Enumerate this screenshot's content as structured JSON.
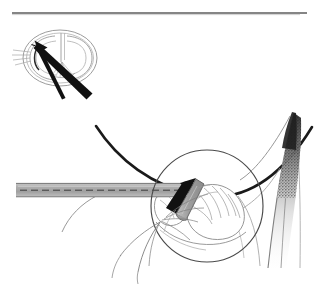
{
  "figure": {
    "title": "Surgical technique illustration",
    "canvas": {
      "width": 316,
      "height": 284
    },
    "background_color": "#ffffff"
  },
  "colors": {
    "ink_black": "#111111",
    "line_dark": "#1a1a1a",
    "line_mid": "#6b6b6b",
    "line_light": "#9a9a9a",
    "line_faint": "#b9b9b9",
    "instrument_gray": "#a8a8a8",
    "instrument_gray_dark": "#8d8d8d",
    "instrument_gray_light": "#c4c4c4",
    "rule_gray": "#5c5c5c",
    "tissue_outline": "#7e7e7e",
    "shade_dark": "#2b2b2b"
  },
  "top_rule": {
    "name": "header-rule",
    "x1": 12,
    "y1": 12,
    "x2": 307,
    "y2": 14,
    "thickness": 1.6,
    "color": "#5c5c5c"
  },
  "inset": {
    "name": "anatomical-inset",
    "center_x": 60,
    "center_y": 58,
    "radius_x": 37,
    "radius_y": 28,
    "label": "anatomical cross-section",
    "outline_color": "#9a9a9a",
    "arrows": [
      {
        "name": "inset-arrow-primary",
        "from_x": 92,
        "from_y": 93,
        "to_x": 40,
        "to_y": 45,
        "width": 6.5,
        "color": "#111111"
      },
      {
        "name": "inset-arrow-secondary",
        "from_x": 65,
        "from_y": 97,
        "to_x": 38,
        "to_y": 45,
        "width": 3.2,
        "color": "#111111"
      }
    ]
  },
  "instrument": {
    "name": "surgical-instrument",
    "shaft": {
      "name": "instrument-shaft",
      "x": 16,
      "y": 183,
      "width": 172,
      "height": 14,
      "fill": "#a8a8a8",
      "edge": "#6f6f6f",
      "centerline_style": "dashed",
      "centerline_color": "#3a3a3a"
    },
    "blade": {
      "name": "instrument-blade-tip",
      "fill": "#111111",
      "angle_deg": 58
    },
    "tip_body": {
      "name": "instrument-tip-body",
      "fill": "#a8a8a8",
      "edge": "#5a5a5a"
    }
  },
  "magnifier": {
    "name": "magnification-circle",
    "center_x": 207,
    "center_y": 206,
    "radius": 56,
    "stroke": "#4a4a4a",
    "stroke_width": 1.1
  },
  "flap": {
    "name": "tissue-flap",
    "apex_x": 294,
    "apex_y": 113,
    "base_y": 268,
    "stipple": true,
    "stipple_color": "#2b2b2b",
    "outline_color": "#8a8a8a"
  },
  "sweep_curve": {
    "name": "tissue-sweep-curve",
    "start_x": 96,
    "start_y": 126,
    "end_x": 312,
    "end_y": 126,
    "color": "#1a1a1a",
    "thickness": 2.6
  },
  "fibers": {
    "name": "suture-fiber-group",
    "color": "#7e7e7e",
    "count": 9
  }
}
